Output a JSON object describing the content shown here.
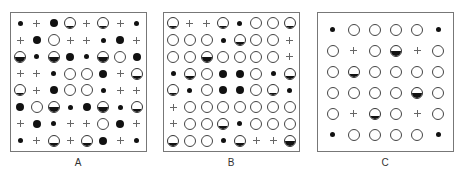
{
  "legend_symbols": {
    "s": "small-dot",
    "B": "large-dot",
    "P": "plus",
    "O": "open-circle",
    "H": "half-filled-circle",
    "Q": "bottom-band-circle"
  },
  "panels": [
    {
      "label": "A",
      "cols": 8,
      "rows": [
        [
          "s",
          "P",
          "B",
          "Q",
          "P",
          "Q",
          "P",
          "s"
        ],
        [
          "P",
          "B",
          "O",
          "P",
          "P",
          "s",
          "B",
          "P"
        ],
        [
          "H",
          "s",
          "H",
          "B",
          "s",
          "H",
          "O",
          "B"
        ],
        [
          "P",
          "P",
          "s",
          "O",
          "O",
          "B",
          "P",
          "Q"
        ],
        [
          "Q",
          "P",
          "B",
          "O",
          "O",
          "s",
          "P",
          "P"
        ],
        [
          "B",
          "O",
          "H",
          "s",
          "B",
          "H",
          "s",
          "Q"
        ],
        [
          "P",
          "B",
          "s",
          "P",
          "P",
          "O",
          "B",
          "P"
        ],
        [
          "s",
          "P",
          "Q",
          "P",
          "Q",
          "B",
          "P",
          "s"
        ]
      ]
    },
    {
      "label": "B",
      "cols": 8,
      "rows": [
        [
          "Q",
          "P",
          "P",
          "Q",
          "s",
          "O",
          "O",
          "Q"
        ],
        [
          "O",
          "O",
          "O",
          "s",
          "Q",
          "O",
          "O",
          "P"
        ],
        [
          "O",
          "O",
          "H",
          "O",
          "O",
          "O",
          "O",
          "P"
        ],
        [
          "s",
          "Q",
          "O",
          "B",
          "B",
          "O",
          "s",
          "Q"
        ],
        [
          "Q",
          "s",
          "O",
          "B",
          "B",
          "O",
          "Q",
          "s"
        ],
        [
          "P",
          "O",
          "O",
          "O",
          "O",
          "O",
          "O",
          "O"
        ],
        [
          "P",
          "O",
          "O",
          "Q",
          "s",
          "O",
          "O",
          "O"
        ],
        [
          "Q",
          "O",
          "O",
          "s",
          "Q",
          "P",
          "P",
          "H"
        ]
      ]
    },
    {
      "label": "C",
      "cols": 6,
      "rows": [
        [
          "s",
          "O",
          "O",
          "O",
          "O",
          "s"
        ],
        [
          "O",
          "P",
          "O",
          "H",
          "P",
          "O"
        ],
        [
          "O",
          "Q",
          "O",
          "O",
          "O",
          "O"
        ],
        [
          "O",
          "O",
          "O",
          "O",
          "H",
          "O"
        ],
        [
          "O",
          "P",
          "Q",
          "O",
          "P",
          "O"
        ],
        [
          "s",
          "O",
          "O",
          "O",
          "O",
          "s"
        ]
      ]
    }
  ]
}
